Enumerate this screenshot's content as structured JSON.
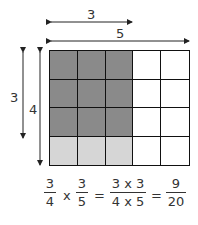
{
  "diagram": {
    "dimensions": {
      "top_inner_label": "3",
      "top_outer_label": "5",
      "left_inner_label": "3",
      "left_outer_label": "4"
    },
    "grid": {
      "columns": 5,
      "rows": 4,
      "dark_region": {
        "columns": 3,
        "rows": 3
      },
      "light_region": {
        "columns": 3,
        "rows": 4
      },
      "colors": {
        "dark": "#8a8a8a",
        "light": "#d6d6d6",
        "empty": "#ffffff",
        "lines": "#111111"
      }
    },
    "equation": {
      "f1": {
        "num": "3",
        "den": "4"
      },
      "op1": "x",
      "f2": {
        "num": "3",
        "den": "5"
      },
      "eq1": "=",
      "f3": {
        "num": "3 x 3",
        "den": "4 x 5"
      },
      "eq2": "=",
      "f4": {
        "num": "9",
        "den": "20"
      }
    }
  }
}
